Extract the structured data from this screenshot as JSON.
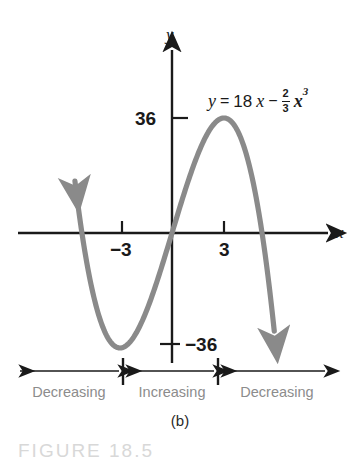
{
  "figure": {
    "caption": "(b)",
    "figure_ref": "FIGURE 18.5",
    "background_color": "#ffffff",
    "curve_color": "#8a8a8a",
    "axis_color": "#1a1a1a",
    "interval_label_color": "#8c8c8c"
  },
  "equation": {
    "lhs": "y",
    "equals": "=",
    "coefficient": "18",
    "x_linear": "x",
    "minus": "−",
    "frac_numerator": "2",
    "frac_denominator": "3",
    "x_cubic": "x",
    "exponent": "3",
    "full_text": "y = 18x − (2/3)x³"
  },
  "axes": {
    "x_label": "x",
    "y_label": "y",
    "x_ticks": [
      {
        "label": "−3",
        "value": -3
      },
      {
        "label": "3",
        "value": 3
      }
    ],
    "y_ticks": [
      {
        "label": "36",
        "value": 36
      },
      {
        "label": "−36",
        "value": -36
      }
    ]
  },
  "intervals": [
    {
      "label": "Decreasing",
      "id": "left-decreasing"
    },
    {
      "label": "Increasing",
      "id": "middle-increasing"
    },
    {
      "label": "Decreasing",
      "id": "right-decreasing"
    }
  ],
  "chart_data": {
    "type": "line",
    "title": "",
    "xlabel": "x",
    "ylabel": "y",
    "function": "y = 18x - (2/3)x^3",
    "xlim": [
      -5.6,
      5.9
    ],
    "ylim": [
      -62,
      62
    ],
    "grid": false,
    "legend": null,
    "annotations": [
      {
        "text": "y = 18x − (2/3)x³",
        "x": 3.1,
        "y": 52
      },
      {
        "text": "Decreasing",
        "interval": [
          -5.6,
          -3
        ]
      },
      {
        "text": "Increasing",
        "interval": [
          -3,
          3
        ]
      },
      {
        "text": "Decreasing",
        "interval": [
          3,
          5.9
        ]
      }
    ],
    "critical_points": [
      {
        "x": -3,
        "y": -36,
        "type": "local-minimum"
      },
      {
        "x": 3,
        "y": 36,
        "type": "local-maximum"
      }
    ],
    "x_intercepts": [
      -5.196,
      0,
      5.196
    ],
    "x": [
      -5.35,
      -5.0,
      -4.5,
      -4.0,
      -3.5,
      -3.0,
      -2.5,
      -2.0,
      -1.5,
      -1.0,
      -0.5,
      0.0,
      0.5,
      1.0,
      1.5,
      2.0,
      2.5,
      3.0,
      3.5,
      4.0,
      4.5,
      5.0,
      5.35
    ],
    "values": [
      5.76,
      1.67,
      -20.25,
      -29.33,
      -34.42,
      -36.0,
      -34.58,
      -30.67,
      -24.75,
      -17.33,
      -8.92,
      0.0,
      8.92,
      17.33,
      24.75,
      30.67,
      34.58,
      36.0,
      34.42,
      29.33,
      20.25,
      1.67,
      -5.76
    ],
    "series": [
      {
        "name": "y = 18x - (2/3)x^3",
        "color": "#8a8a8a",
        "values": [
          5.76,
          1.67,
          -20.25,
          -29.33,
          -34.42,
          -36.0,
          -34.58,
          -30.67,
          -24.75,
          -17.33,
          -8.92,
          0.0,
          8.92,
          17.33,
          24.75,
          30.67,
          34.58,
          36.0,
          34.42,
          29.33,
          20.25,
          1.67,
          -5.76
        ]
      }
    ]
  }
}
